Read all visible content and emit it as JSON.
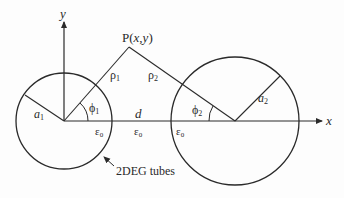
{
  "diagram": {
    "type": "geometry-schematic",
    "axes": {
      "x_label": "x",
      "y_label": "y"
    },
    "point": {
      "label_prefix": "P(",
      "label_x": "x",
      "label_comma": ",",
      "label_y": "y",
      "label_suffix": ")"
    },
    "distances": {
      "rho1": "ρ",
      "rho1_sub": "1",
      "rho2": "ρ",
      "rho2_sub": "2",
      "d": "d"
    },
    "radii": {
      "a1": "a",
      "a1_sub": "1",
      "a2": "a",
      "a2_sub": "2"
    },
    "angles": {
      "phi1": "ϕ",
      "phi1_sub": "1",
      "phi2": "ϕ",
      "phi2_sub": "2"
    },
    "permittivity": {
      "eps_symbol": "ε",
      "eps_sub": "0"
    },
    "annotation": {
      "tubes_label": "2DEG tubes"
    },
    "colors": {
      "stroke": "#2a2a2a",
      "background": "#fdfdfd"
    }
  }
}
